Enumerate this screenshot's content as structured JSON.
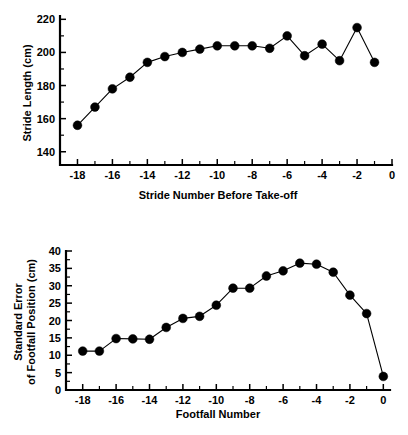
{
  "figure": {
    "background": "#ffffff",
    "ink": "#000000"
  },
  "chart_data": [
    {
      "type": "line",
      "id": "stride-length",
      "title": "",
      "xlabel": "Stride Number Before Take-off",
      "ylabel": "Stride Length (cm)",
      "xlim": [
        -19,
        0
      ],
      "ylim": [
        132,
        222
      ],
      "grid": false,
      "legend": "none",
      "marker": "filled-circle",
      "xticks": [
        -18,
        -16,
        -14,
        -12,
        -10,
        -8,
        -6,
        -4,
        -2,
        0
      ],
      "xticklabels": [
        "-18",
        "-16",
        "-14",
        "-12",
        "-10",
        "-8",
        "-6",
        "-4",
        "-2",
        "0"
      ],
      "xminorticks": [
        -19,
        -17,
        -15,
        -13,
        -11,
        -9,
        -7,
        -5,
        -3,
        -1
      ],
      "yticks": [
        140,
        160,
        180,
        200,
        220
      ],
      "yticklabels": [
        "140",
        "160",
        "180",
        "200",
        "220"
      ],
      "yminorticks": [
        150,
        170,
        190,
        210
      ],
      "x": [
        -18,
        -17,
        -16,
        -15,
        -14,
        -13,
        -12,
        -11,
        -10,
        -9,
        -8,
        -7,
        -6,
        -5,
        -4,
        -3,
        -2,
        -1
      ],
      "values": [
        156,
        167,
        178,
        185,
        194,
        197.5,
        200,
        202,
        204,
        204,
        204,
        202.5,
        210,
        198,
        205,
        195,
        215,
        194
      ]
    },
    {
      "type": "line",
      "id": "footfall-standard-error",
      "title": "",
      "xlabel": "Footfall Number",
      "ylabel_line1": "Standard Error",
      "ylabel_line2": "of Footfall Position (cm)",
      "xlim": [
        -19,
        0.4
      ],
      "ylim": [
        0,
        40
      ],
      "grid": false,
      "legend": "none",
      "marker": "filled-circle",
      "xticks": [
        -18,
        -16,
        -14,
        -12,
        -10,
        -8,
        -6,
        -4,
        -2,
        0
      ],
      "xticklabels": [
        "-18",
        "-16",
        "-14",
        "-12",
        "-10",
        "-8",
        "-6",
        "-4",
        "-2",
        "0"
      ],
      "xminorticks": [
        -19,
        -17,
        -15,
        -13,
        -11,
        -9,
        -7,
        -5,
        -3,
        -1
      ],
      "yticks": [
        0,
        5,
        10,
        15,
        20,
        25,
        30,
        35,
        40
      ],
      "yticklabels": [
        "0",
        "5",
        "10",
        "15",
        "20",
        "25",
        "30",
        "35",
        "40"
      ],
      "yminorticks": [
        2.5,
        7.5,
        12.5,
        17.5,
        22.5,
        27.5,
        32.5,
        37.5
      ],
      "x": [
        -18,
        -17,
        -16,
        -15,
        -14,
        -13,
        -12,
        -11,
        -10,
        -9,
        -8,
        -7,
        -6,
        -5,
        -4,
        -3,
        -2,
        -1,
        0
      ],
      "values": [
        11.2,
        11.2,
        14.8,
        14.7,
        14.6,
        18.0,
        20.6,
        21.2,
        24.4,
        29.3,
        29.3,
        32.8,
        34.3,
        36.5,
        36.2,
        33.9,
        27.3,
        22.0,
        3.9
      ]
    }
  ]
}
